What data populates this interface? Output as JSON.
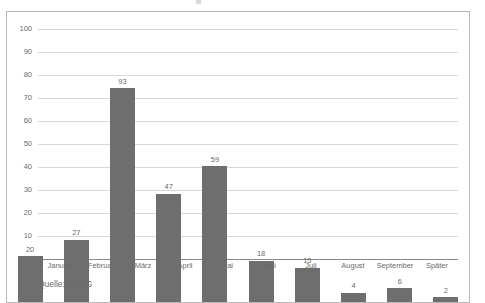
{
  "chart_data": {
    "type": "bar",
    "title": "",
    "xlabel": "",
    "ylabel": "",
    "categories": [
      "Januar",
      "Februar",
      "März",
      "April",
      "Mai",
      "Juni",
      "Juli",
      "August",
      "September",
      "Später"
    ],
    "values": [
      20,
      27,
      93,
      47,
      59,
      18,
      15,
      4,
      6,
      2
    ],
    "value_labels": [
      "20",
      "27",
      "93",
      "47",
      "59",
      "18",
      "15",
      "4",
      "6",
      "2"
    ],
    "ylim": [
      0,
      100
    ],
    "yticks": [
      0,
      10,
      20,
      30,
      40,
      50,
      60,
      70,
      80,
      90,
      100
    ],
    "ytick_labels": [
      "0",
      "10",
      "20",
      "30",
      "40",
      "50",
      "60",
      "70",
      "80",
      "90",
      "100"
    ],
    "grid": true,
    "legend": false,
    "legend_position": "none",
    "bar_color": "#6e6e6e",
    "gridline_color": "#d8d8d8",
    "axis_color": "#8a8a8a",
    "text_color": "#6b6b6b",
    "background_color": "#ffffff",
    "border_color": "#b9b9b9"
  },
  "source": {
    "label": "Quelle: KPMG"
  }
}
